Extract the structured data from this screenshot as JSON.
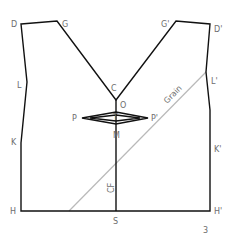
{
  "figure": {
    "page_number": "3",
    "points": {
      "D": "D",
      "G": "G",
      "C": "C",
      "O": "O",
      "G_prime": "G'",
      "D_prime": "D'",
      "L": "L",
      "L_prime": "L'",
      "K": "K",
      "K_prime": "K'",
      "P": "P",
      "P_prime": "P'",
      "T": "T",
      "M": "M",
      "H": "H",
      "S": "S",
      "H_prime": "H'"
    },
    "annotations": {
      "grain": "Grain",
      "center_front": "CF"
    },
    "colors": {
      "outline": "#111111",
      "grain_line": "#b9b9b9",
      "label": "#6d6d6d"
    }
  }
}
